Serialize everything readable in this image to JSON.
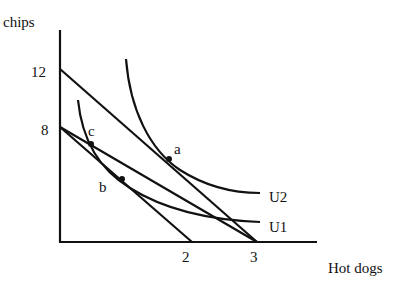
{
  "axes": {
    "y_label": "chips",
    "x_label": "Hot dogs",
    "y_ticks": [
      "12",
      "8"
    ],
    "x_ticks": [
      "2",
      "3"
    ]
  },
  "curves": {
    "u2_label": "U2",
    "u1_label": "U1"
  },
  "points": {
    "a": "a",
    "b": "b",
    "c": "c"
  },
  "budget_lines": [
    {
      "from": "12 chips",
      "to": "3 hot dogs"
    },
    {
      "from": "8 chips",
      "to": "3 hot dogs"
    },
    {
      "from": "8 chips",
      "to": "2 hot dogs"
    }
  ]
}
